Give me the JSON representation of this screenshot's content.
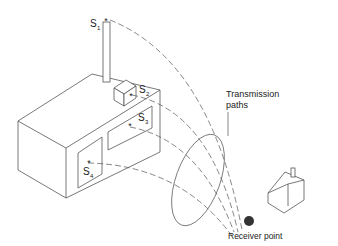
{
  "labels": {
    "s1": "S",
    "s1_sub": "1",
    "s2": "S",
    "s2_sub": "2",
    "s3": "S",
    "s3_sub": "3",
    "s4": "S",
    "s4_sub": "4",
    "transmission_line1": "Transmission",
    "transmission_line2": "paths",
    "receiver": "Receiver point"
  },
  "colors": {
    "line": "#555555",
    "receiver": "#333333"
  }
}
